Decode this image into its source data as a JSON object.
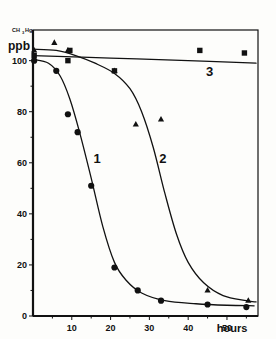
{
  "figure": {
    "yaxis_unit_label": "ppb",
    "yaxis_species_main": "CH",
    "yaxis_species_sub": "3",
    "yaxis_species_tail": "Hg",
    "xaxis_unit_label": "hours"
  },
  "chart_data": {
    "type": "line",
    "title": "",
    "subtitle": "",
    "xlabel": "hours",
    "ylabel": "ppb",
    "ylabel_species": "CH3Hg",
    "xlim": [
      0,
      58
    ],
    "ylim": [
      0,
      112
    ],
    "xticks": [
      10,
      20,
      30,
      40,
      50
    ],
    "xtick_labels": [
      "10",
      "20",
      "30",
      "40",
      "50"
    ],
    "xminor_ticks": [
      5,
      15,
      25,
      35,
      45,
      55
    ],
    "yticks": [
      0,
      20,
      40,
      60,
      80,
      100
    ],
    "ytick_labels": [
      "0",
      "20",
      "40",
      "60",
      "80",
      "100"
    ],
    "yminor_ticks": [
      10,
      30,
      50,
      70,
      90
    ],
    "grid": false,
    "legend": "inline-curve-numbers",
    "annotations": [
      {
        "text": "1",
        "x": 16.5,
        "y": 60
      },
      {
        "text": "2",
        "x": 33.5,
        "y": 60
      },
      {
        "text": "3",
        "x": 45.5,
        "y": 94
      }
    ],
    "series": [
      {
        "name": "1",
        "label": "1",
        "marker": "circle",
        "points": [
          {
            "x": 0.3,
            "y": 100
          },
          {
            "x": 6.0,
            "y": 96
          },
          {
            "x": 9.0,
            "y": 79
          },
          {
            "x": 11.5,
            "y": 72
          },
          {
            "x": 15.0,
            "y": 51
          },
          {
            "x": 21.0,
            "y": 19
          },
          {
            "x": 27.0,
            "y": 10
          },
          {
            "x": 33.0,
            "y": 6
          },
          {
            "x": 45.0,
            "y": 4.5
          },
          {
            "x": 55.0,
            "y": 3.5
          }
        ],
        "curve": [
          {
            "x": 0.0,
            "y": 100.5
          },
          {
            "x": 4.0,
            "y": 99
          },
          {
            "x": 7.0,
            "y": 94
          },
          {
            "x": 9.5,
            "y": 85
          },
          {
            "x": 12.0,
            "y": 72
          },
          {
            "x": 15.0,
            "y": 54
          },
          {
            "x": 18.0,
            "y": 35
          },
          {
            "x": 21.0,
            "y": 21
          },
          {
            "x": 24.0,
            "y": 14
          },
          {
            "x": 28.0,
            "y": 9
          },
          {
            "x": 34.0,
            "y": 6
          },
          {
            "x": 42.0,
            "y": 4.8
          },
          {
            "x": 50.0,
            "y": 4.2
          },
          {
            "x": 57.0,
            "y": 4.0
          }
        ]
      },
      {
        "name": "2",
        "label": "2",
        "marker": "triangle",
        "points": [
          {
            "x": 0.3,
            "y": 104
          },
          {
            "x": 5.5,
            "y": 107
          },
          {
            "x": 9.0,
            "y": 104
          },
          {
            "x": 21.0,
            "y": 96
          },
          {
            "x": 26.5,
            "y": 75
          },
          {
            "x": 33.0,
            "y": 77
          },
          {
            "x": 45.0,
            "y": 10
          },
          {
            "x": 55.5,
            "y": 6
          }
        ],
        "curve": [
          {
            "x": 0.0,
            "y": 104.5
          },
          {
            "x": 6.0,
            "y": 104
          },
          {
            "x": 11.0,
            "y": 102
          },
          {
            "x": 16.0,
            "y": 99
          },
          {
            "x": 21.0,
            "y": 95
          },
          {
            "x": 25.0,
            "y": 89
          },
          {
            "x": 28.0,
            "y": 80
          },
          {
            "x": 31.0,
            "y": 66
          },
          {
            "x": 34.0,
            "y": 48
          },
          {
            "x": 37.0,
            "y": 32
          },
          {
            "x": 40.0,
            "y": 21
          },
          {
            "x": 44.0,
            "y": 13
          },
          {
            "x": 49.0,
            "y": 8
          },
          {
            "x": 55.0,
            "y": 6
          },
          {
            "x": 57.5,
            "y": 5.5
          }
        ]
      },
      {
        "name": "3",
        "label": "3",
        "marker": "square",
        "points": [
          {
            "x": 0.3,
            "y": 102
          },
          {
            "x": 9.0,
            "y": 100
          },
          {
            "x": 9.5,
            "y": 104
          },
          {
            "x": 21.0,
            "y": 96
          },
          {
            "x": 43.0,
            "y": 104
          },
          {
            "x": 54.5,
            "y": 103
          }
        ],
        "curve": [
          {
            "x": 0.0,
            "y": 102
          },
          {
            "x": 20.0,
            "y": 101
          },
          {
            "x": 40.0,
            "y": 100
          },
          {
            "x": 57.5,
            "y": 99
          }
        ]
      }
    ]
  }
}
